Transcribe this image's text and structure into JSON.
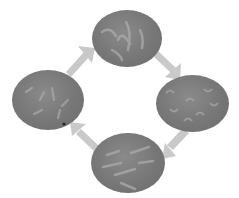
{
  "diagram": {
    "type": "cycle",
    "nodes": [
      {
        "id": "top",
        "image": "micrograph-elongated-cells"
      },
      {
        "id": "right",
        "image": "micrograph-curved-cells"
      },
      {
        "id": "bottom",
        "image": "micrograph-rod-cells"
      },
      {
        "id": "left",
        "image": "micrograph-scattered-cells"
      }
    ],
    "edges": [
      {
        "from": "top",
        "to": "right"
      },
      {
        "from": "right",
        "to": "bottom"
      },
      {
        "from": "bottom",
        "to": "left"
      },
      {
        "from": "left",
        "to": "top"
      }
    ],
    "colors": {
      "circle": "#7a7a7a",
      "arrow": "#c8c8c8",
      "cell_highlight": "#a8a8a8"
    }
  }
}
